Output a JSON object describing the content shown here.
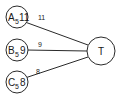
{
  "diagram": {
    "type": "graph",
    "nodes": [
      {
        "id": "A",
        "letter": "A",
        "subscript": "5",
        "value": "11"
      },
      {
        "id": "B",
        "letter": "B",
        "subscript": "5",
        "value": "9"
      },
      {
        "id": "C",
        "letter": "C",
        "subscript": "5",
        "value": "8"
      },
      {
        "id": "T",
        "label": "T"
      }
    ],
    "edges": [
      {
        "from": "A",
        "to": "T",
        "label": "11"
      },
      {
        "from": "B",
        "to": "T",
        "label": "9"
      },
      {
        "from": "C",
        "to": "T",
        "label": "8"
      }
    ]
  }
}
